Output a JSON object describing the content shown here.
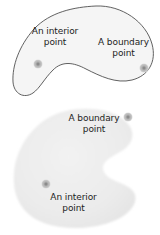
{
  "figure": {
    "width": 160,
    "height": 235,
    "background": "#ffffff"
  },
  "colors": {
    "outline": "#4a4a4a",
    "region_fill_top": "#f4f4f4",
    "region_fill_bottom": "#ededed",
    "dot_fill": "#b6b6b6",
    "dot_core": "#8e8e8e",
    "text": "#1d1d1d"
  },
  "regions": [
    {
      "id": "top-region",
      "name": "bean-region-outlined",
      "style": "outlined",
      "fill": "#f4f4f4",
      "stroke": "#4a4a4a",
      "stroke_width": 0.9
    },
    {
      "id": "bottom-region",
      "name": "bean-region-filled",
      "style": "filled-no-outline",
      "fill": "#ededed",
      "stroke": "none",
      "stroke_width": 0
    }
  ],
  "points": [
    {
      "id": "top-interior",
      "kind": "interior",
      "x": 38,
      "y": 64,
      "r": 4.6
    },
    {
      "id": "top-boundary",
      "kind": "boundary",
      "x": 144,
      "y": 68,
      "r": 4.6
    },
    {
      "id": "bottom-boundary",
      "kind": "boundary",
      "x": 128,
      "y": 117,
      "r": 4.6
    },
    {
      "id": "bottom-interior",
      "kind": "interior",
      "x": 46,
      "y": 184,
      "r": 4.6
    }
  ],
  "labels": {
    "top_interior": {
      "line1": "An interior",
      "line2": "point"
    },
    "top_boundary": {
      "line1": "A boundary",
      "line2": "point"
    },
    "bottom_boundary": {
      "line1": "A boundary",
      "line2": "point"
    },
    "bottom_interior": {
      "line1": "An interior",
      "line2": "point"
    }
  }
}
